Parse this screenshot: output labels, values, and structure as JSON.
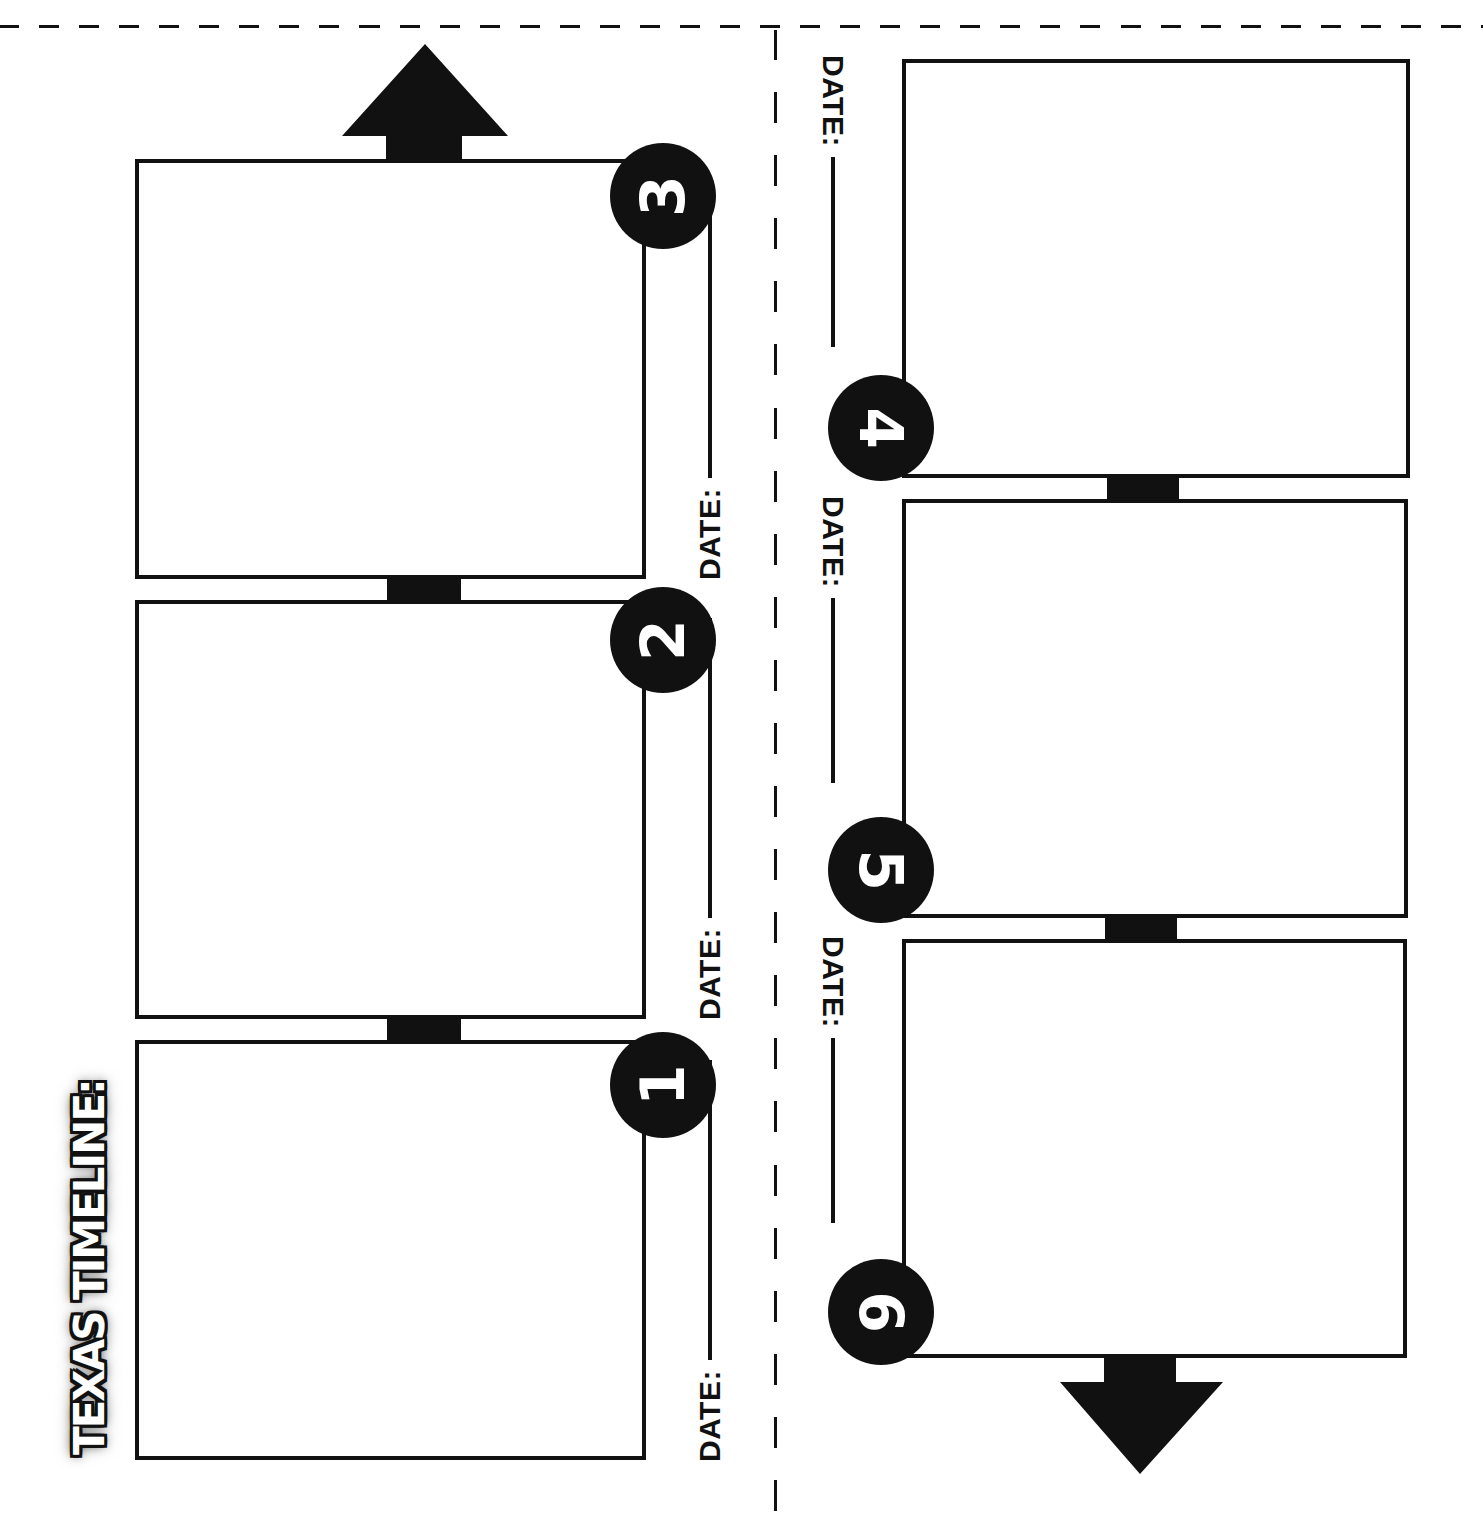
{
  "worksheet": {
    "title": "TEXAS TIMELINE:",
    "colors": {
      "ink": "#111111",
      "paper": "#ffffff"
    },
    "arrows": [
      {
        "name": "up-arrow-icon",
        "direction": "up"
      },
      {
        "name": "down-arrow-icon",
        "direction": "down"
      }
    ],
    "date_label": "DATE:",
    "events": [
      {
        "number": "1",
        "date_label": "DATE:",
        "date_value": ""
      },
      {
        "number": "2",
        "date_label": "DATE:",
        "date_value": ""
      },
      {
        "number": "3",
        "date_label": "DATE:",
        "date_value": ""
      },
      {
        "number": "4",
        "date_label": "DATE:",
        "date_value": ""
      },
      {
        "number": "5",
        "date_label": "DATE:",
        "date_value": ""
      },
      {
        "number": "6",
        "date_label": "DATE:",
        "date_value": ""
      }
    ]
  }
}
